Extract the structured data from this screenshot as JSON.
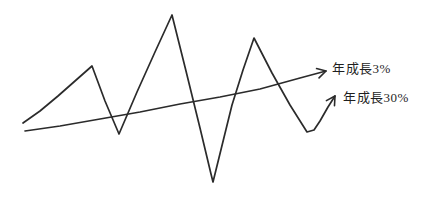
{
  "labels": {
    "growth3": "年成長3%",
    "growth30": "年成長30%"
  },
  "chart_data": {
    "type": "line",
    "title": "",
    "xlabel": "",
    "ylabel": "",
    "axes": "none (hand-drawn conceptual sketch, no axes, ticks or gridlines)",
    "background": "#ffffff",
    "stroke_color": "#2b2b2b",
    "stroke_width": 1.7,
    "legend_position": "right, inline arrow labels",
    "series": [
      {
        "name": "年成長30%",
        "role": "volatile-growth-line",
        "description": "volatile zigzag line: sharp peaks and deep troughs oscillating around the trend, ends with small up-right arrow pointing to its label",
        "arrow": true,
        "points_px": [
          [
            23,
            123
          ],
          [
            40,
            111
          ],
          [
            58,
            96
          ],
          [
            75,
            81
          ],
          [
            92,
            66
          ],
          [
            105,
            101
          ],
          [
            119,
            134
          ],
          [
            137,
            92
          ],
          [
            155,
            52
          ],
          [
            172,
            15
          ],
          [
            186,
            71
          ],
          [
            200,
            128
          ],
          [
            211,
            174
          ],
          [
            213,
            182
          ],
          [
            232,
            105
          ],
          [
            243,
            70
          ],
          [
            254,
            38
          ],
          [
            272,
            73
          ],
          [
            290,
            105
          ],
          [
            307,
            132
          ],
          [
            314,
            130
          ],
          [
            320,
            121
          ],
          [
            328,
            107
          ],
          [
            335,
            96
          ]
        ]
      },
      {
        "name": "年成長3%",
        "role": "steady-trend-line",
        "description": "nearly straight, gently rising trend line crossing the zigzag, ends with arrowhead pointing to its label",
        "arrow": true,
        "points_px": [
          [
            25,
            131
          ],
          [
            60,
            126
          ],
          [
            100,
            119
          ],
          [
            140,
            112
          ],
          [
            180,
            104
          ],
          [
            220,
            97
          ],
          [
            260,
            89
          ],
          [
            300,
            78
          ],
          [
            326,
            71
          ]
        ]
      }
    ],
    "annotations": [
      {
        "text": "年成長3%",
        "meaning": "annual growth 3% (steady line)"
      },
      {
        "text": "年成長30%",
        "meaning": "annual growth 30% (volatile line)"
      }
    ]
  }
}
